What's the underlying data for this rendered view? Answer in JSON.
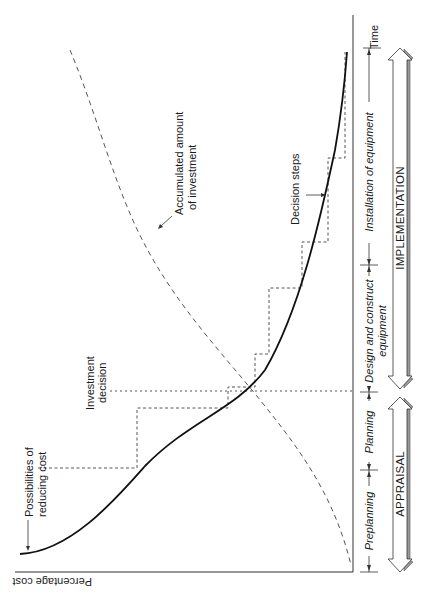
{
  "diagram": {
    "orientation": "rotated 90 degrees clockwise",
    "axes": {
      "y_label": "Percentage cost",
      "x_label": "Time"
    },
    "curves": [
      {
        "name": "Possibilities of reducing cost",
        "style": "solid"
      },
      {
        "name": "Accumulated amount of investment",
        "style": "dashed"
      },
      {
        "name": "Decision steps",
        "style": "dotted-steps"
      }
    ],
    "annotations": {
      "reducing_cost_line1": "Possibilities of",
      "reducing_cost_line2": "reducing cost",
      "investment_decision_line1": "Investment",
      "investment_decision_line2": "decision",
      "accumulated_line1": "Accumulated amount",
      "accumulated_line2": "of investment",
      "decision_steps": "Decision steps"
    },
    "phases": [
      {
        "label": "Preplanning",
        "group": "APPRAISAL"
      },
      {
        "label": "Planning",
        "group": "APPRAISAL"
      },
      {
        "label_line1": "Design and construct",
        "label_line2": "equipment",
        "group": "IMPLEMENTATION"
      },
      {
        "label": "Installation of equipment",
        "group": "IMPLEMENTATION"
      }
    ],
    "groups": {
      "appraisal": "APPRAISAL",
      "implementation": "IMPLEMENTATION"
    },
    "colors": {
      "ink": "#1a1a1a",
      "dashed": "#555555",
      "arrow_shadow": "#9a9a9a"
    }
  }
}
